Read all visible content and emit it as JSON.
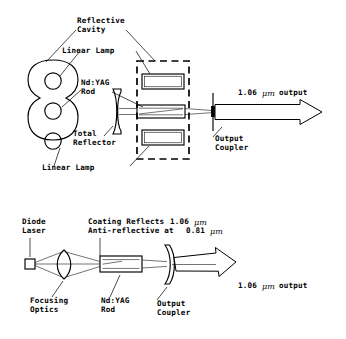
{
  "figure": {
    "ink_color": "#000000",
    "background_color": "#ffffff"
  },
  "top_diagram": {
    "name": "lamp-pumped-ndyag-laser",
    "labels": {
      "reflective_cavity_line1": "Reflective",
      "reflective_cavity_line2": "Cavity",
      "linear_lamp_top": "Linear Lamp",
      "ndyag_rod_line1": "Nd:YAG",
      "ndyag_rod_line2": "Rod",
      "total_reflector_line1": "Total",
      "total_reflector_line2": "Reflector",
      "linear_lamp_bottom": "Linear Lamp",
      "output_coupler_line1": "Output",
      "output_coupler_line2": "Coupler",
      "output_beam_value": "1.06",
      "output_beam_unit": "μm",
      "output_beam_word": "output"
    }
  },
  "bottom_diagram": {
    "name": "diode-pumped-ndyag-laser",
    "labels": {
      "diode_laser_line1": "Diode",
      "diode_laser_line2": "Laser",
      "coating_line1_pre": "Coating Reflects ",
      "coating_line1_value": "1.06",
      "coating_line1_unit": "μm",
      "coating_line2_pre": "Anti-reflective at ",
      "coating_line2_value": "0.81",
      "coating_line2_unit": "μm",
      "focusing_optics_line1": "Focusing",
      "focusing_optics_line2": "Optics",
      "ndyag_rod_line1": "Nd:YAG",
      "ndyag_rod_line2": "Rod",
      "output_coupler_line1": "Output",
      "output_coupler_line2": "Coupler",
      "output_beam_value": "1.06",
      "output_beam_unit": "μm",
      "output_beam_word": "output"
    }
  }
}
